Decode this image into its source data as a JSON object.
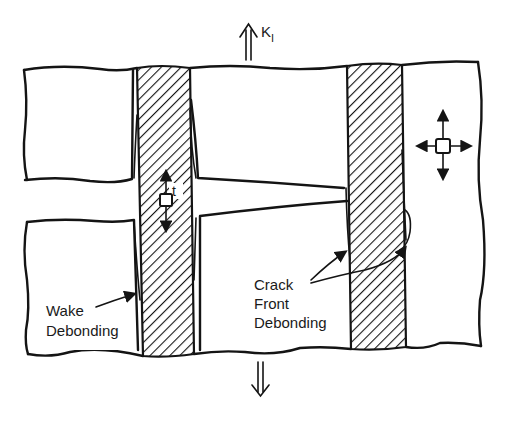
{
  "figure": {
    "colors": {
      "ink": "#141414",
      "background": "#ffffff"
    }
  },
  "loading": {
    "top_arrow": "double-up-arrow",
    "bottom_arrow": "double-down-arrow",
    "symbol_main": "K",
    "symbol_sub": "I"
  },
  "labels": {
    "wake_line1": "Wake",
    "wake_line2": "Debonding",
    "crack_line1": "Crack",
    "crack_line2": "Front",
    "crack_line3": "Debonding",
    "fiber_stress": "t"
  },
  "elements": {
    "fibers": [
      "left-fiber",
      "right-fiber"
    ],
    "matrix_stress_element": "biaxial-stress-element",
    "fiber_stress_element": "uniaxial-stress-element"
  }
}
